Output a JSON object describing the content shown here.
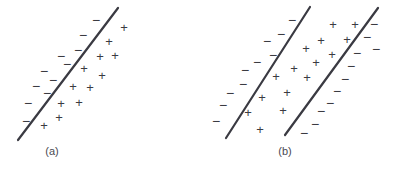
{
  "figure": {
    "background_color": "#ffffff",
    "width": 398,
    "height": 169
  },
  "style": {
    "line_color": "#3a3a42",
    "marker_color": "#3b3b42",
    "caption_color": "#4a4a52",
    "line_width": 2.2
  },
  "panels": [
    {
      "id": "a",
      "caption": "(a)",
      "caption_x": 52,
      "caption_y": 146,
      "lines": [
        {
          "name": "decision-boundary",
          "x1": 18,
          "y1": 140,
          "x2": 118,
          "y2": 8
        }
      ],
      "markers": [
        {
          "symbol": "−",
          "class": "minus",
          "x": 96,
          "y": 20
        },
        {
          "symbol": "−",
          "class": "minus",
          "x": 83,
          "y": 35
        },
        {
          "symbol": "−",
          "class": "minus",
          "x": 78,
          "y": 50
        },
        {
          "symbol": "−",
          "class": "minus",
          "x": 61,
          "y": 56
        },
        {
          "symbol": "−",
          "class": "minus",
          "x": 67,
          "y": 64
        },
        {
          "symbol": "−",
          "class": "minus",
          "x": 44,
          "y": 71
        },
        {
          "symbol": "−",
          "class": "minus",
          "x": 53,
          "y": 80
        },
        {
          "symbol": "−",
          "class": "minus",
          "x": 36,
          "y": 86
        },
        {
          "symbol": "−",
          "class": "minus",
          "x": 47,
          "y": 93
        },
        {
          "symbol": "−",
          "class": "minus",
          "x": 28,
          "y": 103
        },
        {
          "symbol": "−",
          "class": "minus",
          "x": 26,
          "y": 121
        },
        {
          "symbol": "+",
          "class": "plus",
          "x": 124,
          "y": 27
        },
        {
          "symbol": "+",
          "class": "plus",
          "x": 109,
          "y": 41
        },
        {
          "symbol": "+",
          "class": "plus",
          "x": 115,
          "y": 55
        },
        {
          "symbol": "+",
          "class": "plus",
          "x": 100,
          "y": 56
        },
        {
          "symbol": "+",
          "class": "plus",
          "x": 84,
          "y": 68
        },
        {
          "symbol": "+",
          "class": "plus",
          "x": 102,
          "y": 75
        },
        {
          "symbol": "+",
          "class": "plus",
          "x": 73,
          "y": 86
        },
        {
          "symbol": "+",
          "class": "plus",
          "x": 90,
          "y": 87
        },
        {
          "symbol": "+",
          "class": "plus",
          "x": 61,
          "y": 103
        },
        {
          "symbol": "+",
          "class": "plus",
          "x": 79,
          "y": 102
        },
        {
          "symbol": "+",
          "class": "plus",
          "x": 59,
          "y": 117
        },
        {
          "symbol": "+",
          "class": "plus",
          "x": 44,
          "y": 125
        }
      ]
    },
    {
      "id": "b",
      "caption": "(b)",
      "caption_x": 86,
      "caption_y": 146,
      "lines": [
        {
          "name": "margin-boundary-left",
          "x1": 27,
          "y1": 138,
          "x2": 111,
          "y2": 7
        },
        {
          "name": "margin-boundary-right",
          "x1": 86,
          "y1": 135,
          "x2": 179,
          "y2": 8
        }
      ],
      "markers": [
        {
          "symbol": "−",
          "class": "minus",
          "x": 93,
          "y": 20
        },
        {
          "symbol": "−",
          "class": "minus",
          "x": 82,
          "y": 34
        },
        {
          "symbol": "−",
          "class": "minus",
          "x": 68,
          "y": 41
        },
        {
          "symbol": "−",
          "class": "minus",
          "x": 74,
          "y": 55
        },
        {
          "symbol": "−",
          "class": "minus",
          "x": 58,
          "y": 62
        },
        {
          "symbol": "−",
          "class": "minus",
          "x": 46,
          "y": 70
        },
        {
          "symbol": "−",
          "class": "minus",
          "x": 44,
          "y": 84
        },
        {
          "symbol": "−",
          "class": "minus",
          "x": 31,
          "y": 93
        },
        {
          "symbol": "−",
          "class": "minus",
          "x": 24,
          "y": 105
        },
        {
          "symbol": "−",
          "class": "minus",
          "x": 17,
          "y": 121
        },
        {
          "symbol": "−",
          "class": "minus",
          "x": 175,
          "y": 24
        },
        {
          "symbol": "−",
          "class": "minus",
          "x": 168,
          "y": 37
        },
        {
          "symbol": "−",
          "class": "minus",
          "x": 177,
          "y": 49
        },
        {
          "symbol": "−",
          "class": "minus",
          "x": 158,
          "y": 53
        },
        {
          "symbol": "−",
          "class": "minus",
          "x": 152,
          "y": 66
        },
        {
          "symbol": "−",
          "class": "minus",
          "x": 146,
          "y": 79
        },
        {
          "symbol": "−",
          "class": "minus",
          "x": 138,
          "y": 91
        },
        {
          "symbol": "−",
          "class": "minus",
          "x": 131,
          "y": 103
        },
        {
          "symbol": "−",
          "class": "minus",
          "x": 122,
          "y": 111
        },
        {
          "symbol": "−",
          "class": "minus",
          "x": 116,
          "y": 124
        },
        {
          "symbol": "−",
          "class": "minus",
          "x": 105,
          "y": 133
        },
        {
          "symbol": "+",
          "class": "plus",
          "x": 134,
          "y": 24
        },
        {
          "symbol": "+",
          "class": "plus",
          "x": 156,
          "y": 24
        },
        {
          "symbol": "+",
          "class": "plus",
          "x": 122,
          "y": 40
        },
        {
          "symbol": "+",
          "class": "plus",
          "x": 148,
          "y": 39
        },
        {
          "symbol": "+",
          "class": "plus",
          "x": 107,
          "y": 48
        },
        {
          "symbol": "+",
          "class": "plus",
          "x": 133,
          "y": 54
        },
        {
          "symbol": "+",
          "class": "plus",
          "x": 117,
          "y": 62
        },
        {
          "symbol": "+",
          "class": "plus",
          "x": 95,
          "y": 68
        },
        {
          "symbol": "+",
          "class": "plus",
          "x": 77,
          "y": 76
        },
        {
          "symbol": "+",
          "class": "plus",
          "x": 108,
          "y": 77
        },
        {
          "symbol": "+",
          "class": "plus",
          "x": 88,
          "y": 92
        },
        {
          "symbol": "+",
          "class": "plus",
          "x": 63,
          "y": 97
        },
        {
          "symbol": "+",
          "class": "plus",
          "x": 84,
          "y": 110
        },
        {
          "symbol": "+",
          "class": "plus",
          "x": 49,
          "y": 112
        },
        {
          "symbol": "+",
          "class": "plus",
          "x": 61,
          "y": 129
        }
      ]
    }
  ]
}
